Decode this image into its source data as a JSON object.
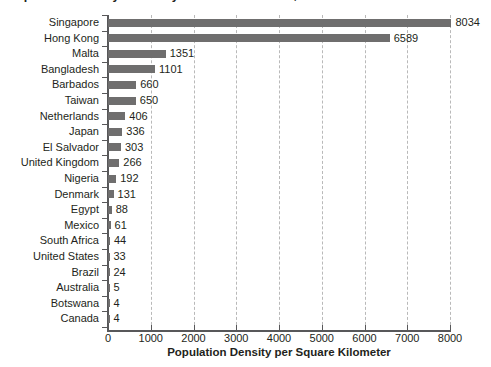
{
  "chart_data": {
    "type": "bar",
    "orientation": "horizontal",
    "title": "Population Density in Twenty Selected Countries, 2014",
    "xlabel": "Population Density per Square Kilometer",
    "ylabel": "",
    "xlim": [
      0,
      8000
    ],
    "xticks": [
      0,
      1000,
      2000,
      3000,
      4000,
      5000,
      6000,
      7000,
      8000
    ],
    "xtick_labels": [
      "0",
      "1000",
      "2000",
      "3000",
      "4000",
      "5000",
      "6000",
      "7000",
      "8000"
    ],
    "grid": "vertical-dashed",
    "legend": "none",
    "bar_color": "#6f6e6e",
    "categories": [
      "Singapore",
      "Hong Kong",
      "Malta",
      "Bangladesh",
      "Barbados",
      "Taiwan",
      "Netherlands",
      "Japan",
      "El Salvador",
      "United Kingdom",
      "Nigeria",
      "Denmark",
      "Egypt",
      "Mexico",
      "South Africa",
      "United States",
      "Brazil",
      "Australia",
      "Botswana",
      "Canada"
    ],
    "values": [
      8034,
      6589,
      1351,
      1101,
      660,
      650,
      406,
      336,
      303,
      266,
      192,
      131,
      88,
      61,
      44,
      33,
      24,
      5,
      4,
      4
    ],
    "value_labels": [
      "8034",
      "6589",
      "1351",
      "1101",
      "660",
      "650",
      "406",
      "336",
      "303",
      "266",
      "192",
      "131",
      "88",
      "61",
      "44",
      "33",
      "24",
      "5",
      "4",
      "4"
    ]
  }
}
